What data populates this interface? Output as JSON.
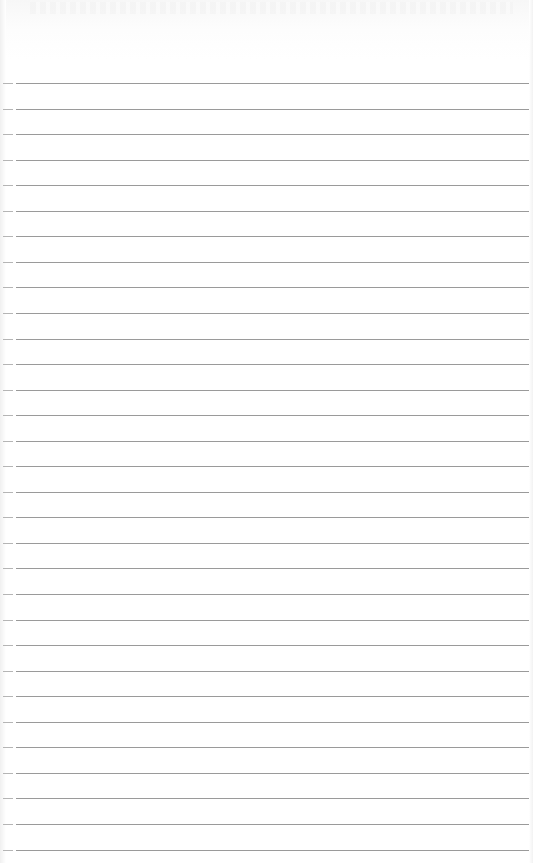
{
  "image": {
    "description": "Blank lined paper sheet",
    "width": 533,
    "height": 863,
    "background_color": "#ffffff",
    "line_color": "#9a9a9a",
    "margin_dash_color": "#b5b5b5"
  },
  "ruling": {
    "line_count": 31,
    "first_line_y": 83,
    "line_spacing": 25.55,
    "line_start_x": 16
  },
  "text_content": []
}
